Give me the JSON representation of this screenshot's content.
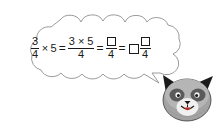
{
  "page": {
    "background_color": "#ffffff",
    "width": 215,
    "height": 129
  },
  "thought_bubble": {
    "name": "thought-bubble",
    "shape": "cloud-callout",
    "outline_color": "#8a8a8a",
    "fill_color": "#ffffff",
    "tail_direction": "bottom-right"
  },
  "equation": {
    "full_text": "3/4 × 5 = (3 × 5)/4 = □/4 = □ □/4",
    "terms": {
      "first_fraction": {
        "numerator": "3",
        "denominator": "4"
      },
      "times_symbol": "×",
      "multiplier": "5",
      "equals_symbol": "=",
      "second_fraction": {
        "numerator": "3 × 5",
        "denominator": "4"
      },
      "third_fraction": {
        "numerator": "",
        "denominator": "4",
        "numerator_is_blank_box": true
      },
      "mixed_number": {
        "whole_part": "",
        "whole_is_blank_box": true,
        "numerator": "",
        "numerator_is_blank_box": true,
        "denominator": "4"
      }
    },
    "blank_box_count": 3,
    "text_color": "#1a1a1a"
  },
  "character": {
    "name": "raccoon-character",
    "type": "cartoon-animal-head",
    "description": "raccoon face with dark pointed ears, gray fur, dark eye patches, white muzzle and red tongue",
    "colors": {
      "ear": "#1b1b1b",
      "fur": "#9a9a9a",
      "fur_light": "#c9c9c9",
      "eye_patch": "#4a4a4a",
      "muzzle": "#f2f2f2",
      "tongue": "#c0392b",
      "outline": "#2a2a2a"
    }
  }
}
